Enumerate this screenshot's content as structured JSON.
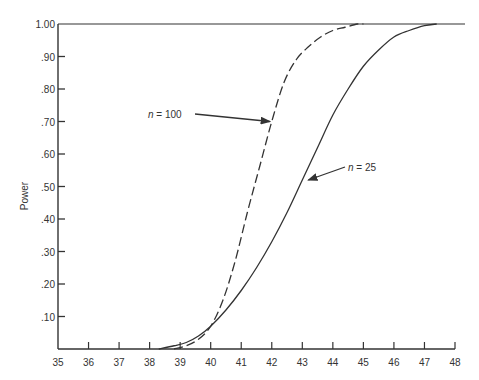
{
  "chart_data": {
    "type": "line",
    "title": "",
    "xlabel": "",
    "ylabel": "Power",
    "xlim": [
      35,
      48
    ],
    "ylim": [
      0,
      1.0
    ],
    "grid": false,
    "x_ticks": [
      "35",
      "36",
      "37",
      "38",
      "39",
      "40",
      "41",
      "42",
      "43",
      "44",
      "45",
      "46",
      "47",
      "48"
    ],
    "y_ticks": [
      ".10",
      ".20",
      ".30",
      ".40",
      ".50",
      ".60",
      ".70",
      ".80",
      ".90",
      "1.00"
    ],
    "series": [
      {
        "name": "n = 100",
        "style": "dashed",
        "x": [
          38.8,
          39.2,
          39.6,
          40.0,
          40.4,
          40.8,
          41.2,
          41.6,
          42.0,
          42.4,
          42.8,
          43.2,
          43.6,
          44.0,
          44.4,
          44.8,
          45.0
        ],
        "y": [
          0.0,
          0.01,
          0.03,
          0.07,
          0.15,
          0.27,
          0.42,
          0.56,
          0.7,
          0.82,
          0.89,
          0.93,
          0.96,
          0.98,
          0.99,
          1.0,
          1.0
        ]
      },
      {
        "name": "n = 25",
        "style": "solid",
        "x": [
          38.3,
          38.8,
          39.2,
          39.6,
          40.0,
          40.5,
          41.0,
          41.5,
          42.0,
          42.5,
          43.0,
          43.5,
          44.0,
          44.5,
          45.0,
          45.5,
          46.0,
          46.5,
          47.0,
          47.4
        ],
        "y": [
          0.0,
          0.01,
          0.02,
          0.04,
          0.07,
          0.12,
          0.18,
          0.25,
          0.33,
          0.42,
          0.52,
          0.62,
          0.72,
          0.8,
          0.87,
          0.92,
          0.96,
          0.98,
          0.995,
          1.0
        ]
      }
    ],
    "annotations": [
      {
        "text": "n = 100",
        "target_x": 42.0,
        "target_y": 0.7
      },
      {
        "text": "n = 25",
        "target_x": 43.1,
        "target_y": 0.52
      }
    ],
    "reference_lines": [
      {
        "y": 1.0,
        "style": "solid"
      }
    ]
  }
}
